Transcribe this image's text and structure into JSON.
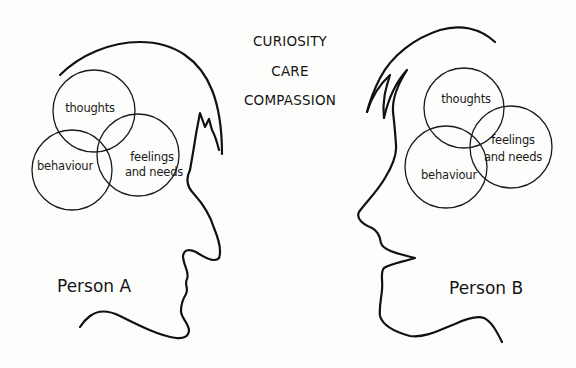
{
  "values": [
    "CURIOSITY",
    "CARE",
    "COMPASSION"
  ],
  "person_a": {
    "label": "Person A",
    "circles": {
      "thoughts": "thoughts",
      "feelings_line1": "feelings",
      "feelings_line2": "and needs",
      "behaviour": "behaviour"
    }
  },
  "person_b": {
    "label": "Person B",
    "circles": {
      "thoughts": "thoughts",
      "feelings_line1": "feelings",
      "feelings_line2": "and needs",
      "behaviour": "behaviour"
    }
  },
  "colors": {
    "line": "#111111",
    "background": "#fdfdfc"
  }
}
